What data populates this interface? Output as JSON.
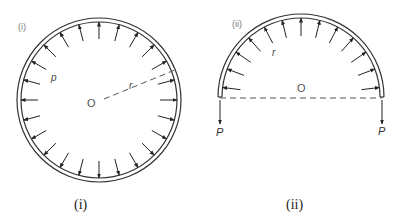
{
  "figure_i": {
    "tag": "(i)",
    "caption": "(i)",
    "pressure_label": "p",
    "radius_label": "r",
    "center_label": "O",
    "arrow_count": 24
  },
  "figure_ii": {
    "tag": "(ii)",
    "caption": "(ii)",
    "radius_label": "r",
    "center_label": "O",
    "left_force_label": "P",
    "right_force_label": "P",
    "arrow_count": 13
  },
  "colors": {
    "stroke": "#333333",
    "dash": "#555555"
  }
}
